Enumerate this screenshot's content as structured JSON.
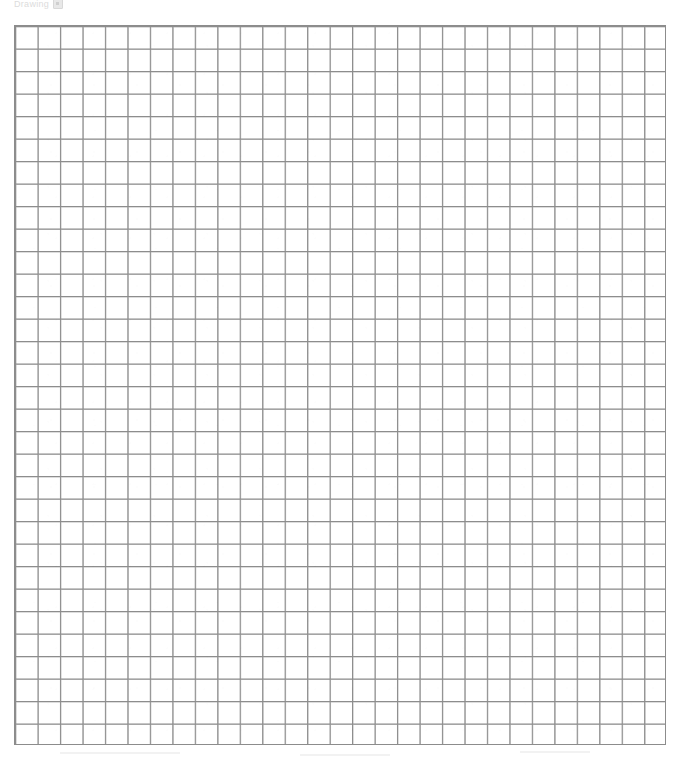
{
  "canvas": {
    "width": 681,
    "height": 760,
    "background_color": "#ffffff"
  },
  "header": {
    "label": "Drawing",
    "icon": "document-icon",
    "color": "#dcdcdc",
    "note": "faint, partially clipped by the top edge of the screenshot"
  },
  "grid": {
    "name": "graph-paper-grid",
    "x": 14,
    "y": 25,
    "width": 652,
    "height": 720,
    "columns": 29,
    "rows": 32,
    "cell_width": 22.48,
    "cell_height": 22.5,
    "line_color": "#8c8c8c",
    "line_color_secondary": "#b8b8b8",
    "line_width": 1,
    "border_color": "#8c8c8c",
    "fill_color": "#ffffff"
  },
  "chart_data": {
    "type": "table",
    "title": "Drawing",
    "xlabel": "",
    "ylabel": "",
    "grid": true,
    "legend": "none",
    "columns": 29,
    "rows": 32,
    "categories": [],
    "values": [],
    "annotations": []
  }
}
